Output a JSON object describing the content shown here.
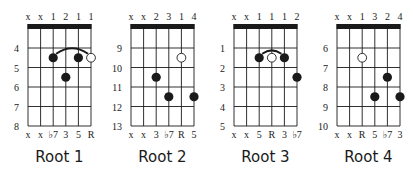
{
  "colors": {
    "ink": "#1a1a1a",
    "open_dot_fill": "#ffffff",
    "background": "#ffffff"
  },
  "diagrams": [
    {
      "title": "Root 1",
      "fingers": [
        "x",
        "x",
        "1",
        "2",
        "1",
        "1"
      ],
      "fret_numbers": [
        "4",
        "5",
        "6",
        "7",
        "8"
      ],
      "intervals": [
        "x",
        "x",
        "♭7",
        "3",
        "5",
        "R"
      ],
      "dots": [
        {
          "string": 3,
          "fret": 2,
          "type": "filled"
        },
        {
          "string": 4,
          "fret": 3,
          "type": "filled"
        },
        {
          "string": 5,
          "fret": 2,
          "type": "filled"
        },
        {
          "string": 6,
          "fret": 2,
          "type": "open"
        }
      ],
      "barre": {
        "from": 3,
        "to": 6,
        "fret": 2
      }
    },
    {
      "title": "Root 2",
      "fingers": [
        "x",
        "x",
        "2",
        "3",
        "1",
        "4"
      ],
      "fret_numbers": [
        "9",
        "10",
        "11",
        "12",
        "13"
      ],
      "intervals": [
        "x",
        "x",
        "3",
        "♭7",
        "R",
        "5"
      ],
      "dots": [
        {
          "string": 5,
          "fret": 2,
          "type": "open"
        },
        {
          "string": 3,
          "fret": 3,
          "type": "filled"
        },
        {
          "string": 4,
          "fret": 4,
          "type": "filled"
        },
        {
          "string": 6,
          "fret": 4,
          "type": "filled"
        }
      ],
      "barre": null
    },
    {
      "title": "Root 3",
      "fingers": [
        "x",
        "x",
        "1",
        "1",
        "1",
        "2"
      ],
      "fret_numbers": [
        "1",
        "2",
        "3",
        "4",
        "5"
      ],
      "intervals": [
        "x",
        "x",
        "5",
        "R",
        "3",
        "♭7"
      ],
      "dots": [
        {
          "string": 3,
          "fret": 2,
          "type": "filled"
        },
        {
          "string": 4,
          "fret": 2,
          "type": "open"
        },
        {
          "string": 5,
          "fret": 2,
          "type": "filled"
        },
        {
          "string": 6,
          "fret": 3,
          "type": "filled"
        }
      ],
      "barre": {
        "from": 3,
        "to": 5,
        "fret": 2
      }
    },
    {
      "title": "Root 4",
      "fingers": [
        "x",
        "x",
        "1",
        "3",
        "2",
        "4"
      ],
      "fret_numbers": [
        "6",
        "7",
        "8",
        "9",
        "10"
      ],
      "intervals": [
        "x",
        "x",
        "R",
        "5",
        "♭7",
        "3"
      ],
      "dots": [
        {
          "string": 3,
          "fret": 2,
          "type": "open"
        },
        {
          "string": 5,
          "fret": 3,
          "type": "filled"
        },
        {
          "string": 4,
          "fret": 4,
          "type": "filled"
        },
        {
          "string": 6,
          "fret": 4,
          "type": "filled"
        }
      ],
      "barre": null
    }
  ]
}
